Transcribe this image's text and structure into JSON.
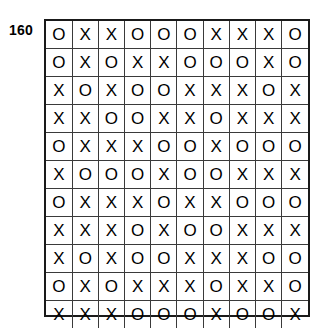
{
  "figure": {
    "label": "160",
    "label_name": "figure-number-160"
  },
  "grid": {
    "rows": 11,
    "columns": 10,
    "border_color": "#1a1a1a",
    "cell_border_color": "#3a3a3a",
    "background_color": "#ffffff",
    "mark_color": "#000000",
    "cells": [
      [
        "O",
        "X",
        "X",
        "O",
        "O",
        "O",
        "X",
        "X",
        "X",
        "O"
      ],
      [
        "O",
        "X",
        "O",
        "X",
        "X",
        "O",
        "O",
        "O",
        "X",
        "O"
      ],
      [
        "X",
        "O",
        "X",
        "O",
        "O",
        "X",
        "X",
        "X",
        "O",
        "X"
      ],
      [
        "X",
        "X",
        "O",
        "O",
        "X",
        "X",
        "O",
        "X",
        "X",
        "X"
      ],
      [
        "O",
        "X",
        "X",
        "X",
        "O",
        "O",
        "X",
        "O",
        "O",
        "O"
      ],
      [
        "X",
        "O",
        "O",
        "O",
        "X",
        "O",
        "O",
        "X",
        "X",
        "X"
      ],
      [
        "O",
        "X",
        "X",
        "X",
        "O",
        "X",
        "X",
        "O",
        "O",
        "O"
      ],
      [
        "X",
        "X",
        "X",
        "O",
        "X",
        "O",
        "O",
        "X",
        "X",
        "X"
      ],
      [
        "X",
        "O",
        "X",
        "O",
        "O",
        "X",
        "X",
        "X",
        "O",
        "O"
      ],
      [
        "O",
        "X",
        "O",
        "X",
        "X",
        "X",
        "O",
        "X",
        "X",
        "O"
      ],
      [
        "X",
        "X",
        "X",
        "O",
        "O",
        "O",
        "X",
        "O",
        "O",
        "X"
      ]
    ]
  }
}
